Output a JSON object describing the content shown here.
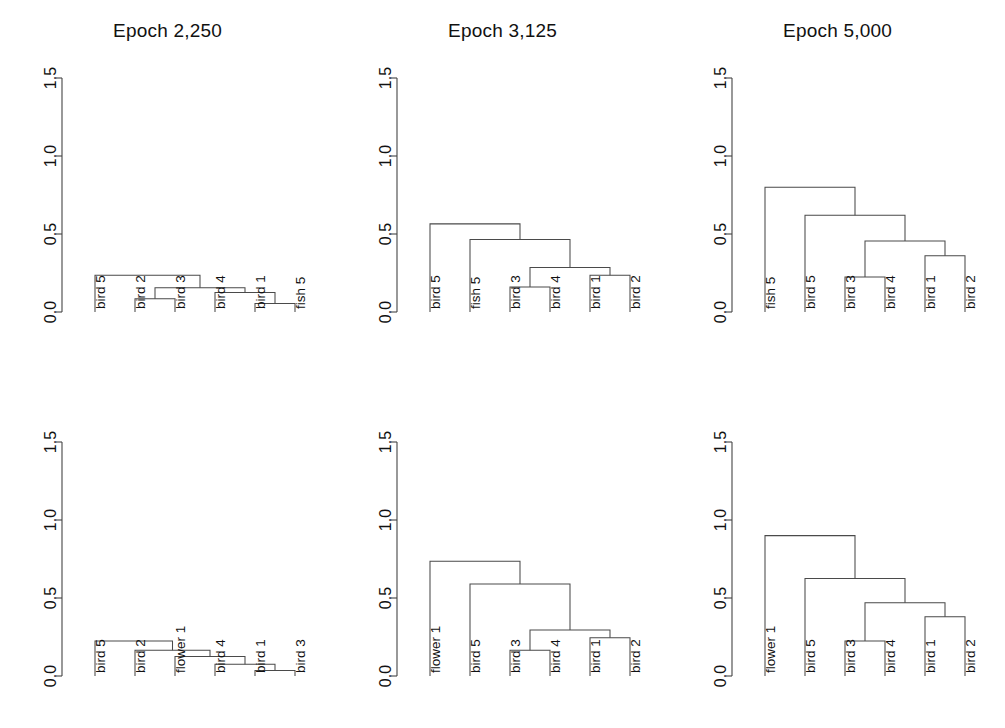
{
  "figure": {
    "width": 1005,
    "height": 728,
    "background_color": "#ffffff",
    "line_color": "#4a4a4a",
    "text_color": "#111111",
    "rows": 2,
    "cols": 3
  },
  "axis": {
    "tick_labels": [
      "0.0",
      "0.5",
      "1.0",
      "1.5"
    ],
    "tick_values": [
      0.0,
      0.5,
      1.0,
      1.5
    ],
    "ylim": [
      0.0,
      1.5
    ],
    "orientation": "vertical",
    "label_rotation_deg": -90,
    "grid": false
  },
  "titles": {
    "epoch_2250": "Epoch 2,250",
    "epoch_3125": "Epoch 3,125",
    "epoch_5000": "Epoch 5,000"
  },
  "chart_data": [
    {
      "id": "panel-r0c0",
      "type": "dendrogram",
      "title": "Epoch 2,250",
      "row": 0,
      "col": 0,
      "xlabel": "",
      "ylabel": "",
      "ylim": [
        0.0,
        1.5
      ],
      "yticks": [
        0.0,
        0.5,
        1.0,
        1.5
      ],
      "grid": false,
      "leaves": [
        "bird 5",
        "bird 2",
        "bird 3",
        "bird 4",
        "bird 1",
        "fish 5"
      ],
      "merges": [
        {
          "name": "m1",
          "left": "bird 2",
          "right": "bird 3",
          "height": 0.085
        },
        {
          "name": "m2",
          "left": "bird 1",
          "right": "fish 5",
          "height": 0.055
        },
        {
          "name": "m3",
          "left": "bird 4",
          "right": "m2",
          "height": 0.125
        },
        {
          "name": "m4",
          "left": "m1",
          "right": "m3",
          "height": 0.155
        },
        {
          "name": "m5",
          "left": "bird 5",
          "right": "m4",
          "height": 0.235
        }
      ],
      "root_height": 0.235
    },
    {
      "id": "panel-r0c1",
      "type": "dendrogram",
      "title": "Epoch 3,125",
      "row": 0,
      "col": 1,
      "xlabel": "",
      "ylabel": "",
      "ylim": [
        0.0,
        1.5
      ],
      "yticks": [
        0.0,
        0.5,
        1.0,
        1.5
      ],
      "grid": false,
      "leaves": [
        "bird 5",
        "fish 5",
        "bird 3",
        "bird 4",
        "bird 1",
        "bird 2"
      ],
      "merges": [
        {
          "name": "m1",
          "left": "bird 3",
          "right": "bird 4",
          "height": 0.16
        },
        {
          "name": "m2",
          "left": "bird 1",
          "right": "bird 2",
          "height": 0.235
        },
        {
          "name": "m3",
          "left": "m1",
          "right": "m2",
          "height": 0.285
        },
        {
          "name": "m4",
          "left": "fish 5",
          "right": "m3",
          "height": 0.465
        },
        {
          "name": "m5",
          "left": "bird 5",
          "right": "m4",
          "height": 0.565
        }
      ],
      "root_height": 0.565
    },
    {
      "id": "panel-r0c2",
      "type": "dendrogram",
      "title": "Epoch 5,000",
      "row": 0,
      "col": 2,
      "xlabel": "",
      "ylabel": "",
      "ylim": [
        0.0,
        1.5
      ],
      "yticks": [
        0.0,
        0.5,
        1.0,
        1.5
      ],
      "grid": false,
      "leaves": [
        "fish 5",
        "bird 5",
        "bird 3",
        "bird 4",
        "bird 1",
        "bird 2"
      ],
      "merges": [
        {
          "name": "m1",
          "left": "bird 3",
          "right": "bird 4",
          "height": 0.225
        },
        {
          "name": "m2",
          "left": "bird 1",
          "right": "bird 2",
          "height": 0.36
        },
        {
          "name": "m3",
          "left": "m1",
          "right": "m2",
          "height": 0.455
        },
        {
          "name": "m4",
          "left": "bird 5",
          "right": "m3",
          "height": 0.62
        },
        {
          "name": "m5",
          "left": "fish 5",
          "right": "m4",
          "height": 0.8
        }
      ],
      "root_height": 0.8
    },
    {
      "id": "panel-r1c0",
      "type": "dendrogram",
      "title": "",
      "row": 1,
      "col": 0,
      "xlabel": "",
      "ylabel": "",
      "ylim": [
        0.0,
        1.5
      ],
      "yticks": [
        0.0,
        0.5,
        1.0,
        1.5
      ],
      "grid": false,
      "leaves": [
        "bird 5",
        "bird 2",
        "flower 1",
        "bird 4",
        "bird 1",
        "bird 3"
      ],
      "merges": [
        {
          "name": "m1",
          "left": "bird 1",
          "right": "bird 3",
          "height": 0.035
        },
        {
          "name": "m2",
          "left": "bird 4",
          "right": "m1",
          "height": 0.075
        },
        {
          "name": "m3",
          "left": "flower 1",
          "right": "m2",
          "height": 0.125
        },
        {
          "name": "m4",
          "left": "bird 2",
          "right": "m3",
          "height": 0.165
        },
        {
          "name": "m5",
          "left": "bird 5",
          "right": "m4",
          "height": 0.225
        }
      ],
      "root_height": 0.225
    },
    {
      "id": "panel-r1c1",
      "type": "dendrogram",
      "title": "",
      "row": 1,
      "col": 1,
      "xlabel": "",
      "ylabel": "",
      "ylim": [
        0.0,
        1.5
      ],
      "yticks": [
        0.0,
        0.5,
        1.0,
        1.5
      ],
      "grid": false,
      "leaves": [
        "flower 1",
        "bird 5",
        "bird 3",
        "bird 4",
        "bird 1",
        "bird 2"
      ],
      "merges": [
        {
          "name": "m1",
          "left": "bird 3",
          "right": "bird 4",
          "height": 0.165
        },
        {
          "name": "m2",
          "left": "bird 1",
          "right": "bird 2",
          "height": 0.245
        },
        {
          "name": "m3",
          "left": "m1",
          "right": "m2",
          "height": 0.295
        },
        {
          "name": "m4",
          "left": "bird 5",
          "right": "m3",
          "height": 0.59
        },
        {
          "name": "m5",
          "left": "flower 1",
          "right": "m4",
          "height": 0.735
        }
      ],
      "root_height": 0.735
    },
    {
      "id": "panel-r1c2",
      "type": "dendrogram",
      "title": "",
      "row": 1,
      "col": 2,
      "xlabel": "",
      "ylabel": "",
      "ylim": [
        0.0,
        1.5
      ],
      "yticks": [
        0.0,
        0.5,
        1.0,
        1.5
      ],
      "grid": false,
      "leaves": [
        "flower 1",
        "bird 5",
        "bird 3",
        "bird 4",
        "bird 1",
        "bird 2"
      ],
      "merges": [
        {
          "name": "m1",
          "left": "bird 3",
          "right": "bird 4",
          "height": 0.225
        },
        {
          "name": "m2",
          "left": "bird 1",
          "right": "bird 2",
          "height": 0.38
        },
        {
          "name": "m3",
          "left": "m1",
          "right": "m2",
          "height": 0.47
        },
        {
          "name": "m4",
          "left": "bird 5",
          "right": "m3",
          "height": 0.625
        },
        {
          "name": "m5",
          "left": "flower 1",
          "right": "m4",
          "height": 0.9
        }
      ],
      "root_height": 0.9
    }
  ]
}
